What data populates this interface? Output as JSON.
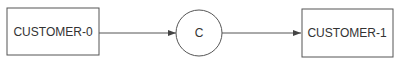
{
  "diagram": {
    "nodes": [
      {
        "id": "customer-0",
        "label": "CUSTOMER-0",
        "shape": "rectangle"
      },
      {
        "id": "c",
        "label": "C",
        "shape": "circle"
      },
      {
        "id": "customer-1",
        "label": "CUSTOMER-1",
        "shape": "rectangle"
      }
    ],
    "edges": [
      {
        "from": "customer-0",
        "to": "c"
      },
      {
        "from": "c",
        "to": "customer-1"
      }
    ],
    "colors": {
      "stroke": "#555555",
      "text": "#333333",
      "background": "#ffffff"
    }
  }
}
